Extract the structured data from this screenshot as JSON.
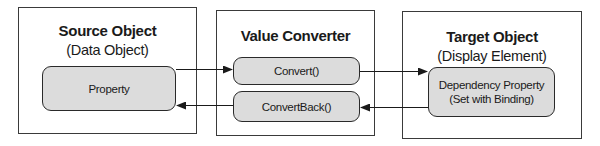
{
  "source": {
    "title": "Source Object",
    "subtitle": "(Data Object)",
    "property_label": "Property"
  },
  "converter": {
    "title": "Value Converter",
    "convert_label": "Convert()",
    "convert_back_label": "ConvertBack()"
  },
  "target": {
    "title": "Target Object",
    "subtitle": "(Display Element)",
    "property_line1": "Dependency Property",
    "property_line2": "(Set with Binding)"
  },
  "colors": {
    "pill_fill": "#dcdcdc",
    "stroke": "#2a2a2a"
  }
}
